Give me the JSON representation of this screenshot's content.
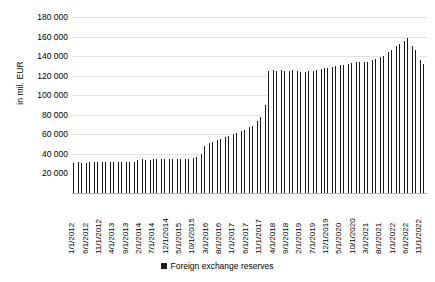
{
  "chart_data": {
    "type": "bar",
    "title": "",
    "xlabel": "",
    "ylabel": "in mil. EUR",
    "ylim": [
      0,
      180000
    ],
    "ytick_values": [
      20000,
      40000,
      60000,
      80000,
      100000,
      120000,
      140000,
      160000,
      180000
    ],
    "ytick_labels": [
      "20 000",
      "40 000",
      "60 000",
      "80 000",
      "100 000",
      "120 000",
      "140 000",
      "160 000",
      "180 000"
    ],
    "grid": true,
    "legend_position": "bottom",
    "series": [
      {
        "name": "Foreign exchange reserves",
        "color": "#1a1a1a",
        "values": [
          31200,
          31000,
          31300,
          31100,
          31400,
          31200,
          31500,
          31300,
          31600,
          31400,
          31700,
          31500,
          31600,
          31400,
          31800,
          31500,
          31900,
          31700,
          32000,
          31800,
          32100,
          31900,
          32200,
          32000,
          34200,
          34000,
          34300,
          34100,
          34400,
          34200,
          34500,
          34300,
          34600,
          34400,
          34700,
          34500,
          34600,
          34400,
          34800,
          34600,
          35000,
          34800,
          35200,
          35000,
          35400,
          36000,
          37000,
          38500,
          40000,
          48000,
          50000,
          51000,
          52000,
          53000,
          54000,
          55000,
          56000,
          57500,
          58500,
          59500,
          60000,
          61000,
          62500,
          63500,
          64500,
          66000,
          67500,
          69000,
          71000,
          74000,
          78000,
          84000,
          90000,
          124500,
          125000,
          125500,
          125000,
          125500,
          125800,
          125200,
          125600,
          125000,
          125400,
          125800,
          124800,
          124200,
          124600,
          124000,
          124400,
          124800,
          125200,
          125800,
          126500,
          127000,
          127500,
          128000,
          128500,
          129000,
          129500,
          130000,
          130500,
          131000,
          131500,
          132000,
          132500,
          133000,
          133500,
          134000,
          132500,
          133500,
          134500,
          135500,
          136500,
          137500,
          138500,
          139500,
          140500,
          142000,
          144000,
          146000,
          148000,
          150000,
          152500,
          154000,
          155500,
          159000,
          153000,
          150000,
          146000,
          141000,
          136000,
          132000,
          130500
        ],
        "x": [
          "1/1/2012",
          "2/1/2012",
          "3/1/2012",
          "4/1/2012",
          "5/1/2012",
          "6/1/2012",
          "7/1/2012",
          "8/1/2012",
          "9/1/2012",
          "10/1/2012",
          "11/1/2012",
          "12/1/2012",
          "1/1/2013",
          "2/1/2013",
          "3/1/2013",
          "4/1/2013",
          "5/1/2013",
          "6/1/2013",
          "7/1/2013",
          "8/1/2013",
          "9/1/2013",
          "10/1/2013",
          "11/1/2013",
          "12/1/2013",
          "1/1/2014",
          "2/1/2014",
          "3/1/2014",
          "4/1/2014",
          "5/1/2014",
          "6/1/2014",
          "7/1/2014",
          "8/1/2014",
          "9/1/2014",
          "10/1/2014",
          "11/1/2014",
          "12/1/2014",
          "1/1/2015",
          "2/1/2015",
          "3/1/2015",
          "4/1/2015",
          "5/1/2015",
          "6/1/2015",
          "7/1/2015",
          "8/1/2015",
          "9/1/2015",
          "10/1/2015",
          "11/1/2015",
          "12/1/2015",
          "1/1/2016",
          "2/1/2016",
          "3/1/2016",
          "4/1/2016",
          "5/1/2016",
          "6/1/2016",
          "7/1/2016",
          "8/1/2016",
          "9/1/2016",
          "10/1/2016",
          "11/1/2016",
          "12/1/2016",
          "1/1/2017",
          "2/1/2017",
          "3/1/2017",
          "4/1/2017",
          "5/1/2017",
          "6/1/2017",
          "7/1/2017",
          "8/1/2017",
          "9/1/2017",
          "10/1/2017",
          "11/1/2017",
          "12/1/2017",
          "1/1/2018",
          "2/1/2018",
          "3/1/2018",
          "4/1/2018",
          "5/1/2018",
          "6/1/2018",
          "7/1/2018",
          "8/1/2018",
          "9/1/2018",
          "10/1/2018",
          "11/1/2018",
          "12/1/2018",
          "1/1/2019",
          "2/1/2019",
          "3/1/2019",
          "4/1/2019",
          "5/1/2019",
          "6/1/2019",
          "7/1/2019",
          "8/1/2019",
          "9/1/2019",
          "10/1/2019",
          "11/1/2019",
          "12/1/2019",
          "1/1/2020",
          "2/1/2020",
          "3/1/2020",
          "4/1/2020",
          "5/1/2020",
          "6/1/2020",
          "7/1/2020",
          "8/1/2020",
          "9/1/2020",
          "10/1/2020",
          "11/1/2020",
          "12/1/2020",
          "1/1/2021",
          "2/1/2021",
          "3/1/2021",
          "4/1/2021",
          "5/1/2021",
          "6/1/2021",
          "7/1/2021",
          "8/1/2021",
          "9/1/2021",
          "10/1/2021",
          "11/1/2021",
          "12/1/2021",
          "1/1/2022",
          "2/1/2022",
          "3/1/2022",
          "4/1/2022",
          "5/1/2022",
          "6/1/2022",
          "7/1/2022",
          "8/1/2022",
          "9/1/2022",
          "10/1/2022",
          "11/1/2022",
          "12/1/2022",
          "1/1/2023"
        ]
      }
    ],
    "xtick_labels": [
      "1/1/2012",
      "6/1/2012",
      "11/1/2012",
      "4/1/2013",
      "9/1/2013",
      "2/1/2014",
      "7/1/2014",
      "12/1/2014",
      "5/1/2015",
      "10/1/2015",
      "3/1/2016",
      "8/1/2016",
      "1/1/2017",
      "6/1/2017",
      "11/1/2017",
      "4/1/2018",
      "9/1/2018",
      "2/1/2019",
      "7/1/2019",
      "12/1/2019",
      "5/1/2020",
      "10/1/2020",
      "3/1/2021",
      "8/1/2021",
      "1/1/2022",
      "6/1/2022",
      "11/1/2022"
    ],
    "xtick_indices": [
      0,
      5,
      10,
      15,
      20,
      25,
      30,
      35,
      40,
      45,
      50,
      55,
      60,
      65,
      70,
      75,
      80,
      85,
      90,
      95,
      100,
      105,
      110,
      115,
      120,
      125,
      130
    ]
  },
  "legend": {
    "label": "Foreign exchange reserves"
  }
}
